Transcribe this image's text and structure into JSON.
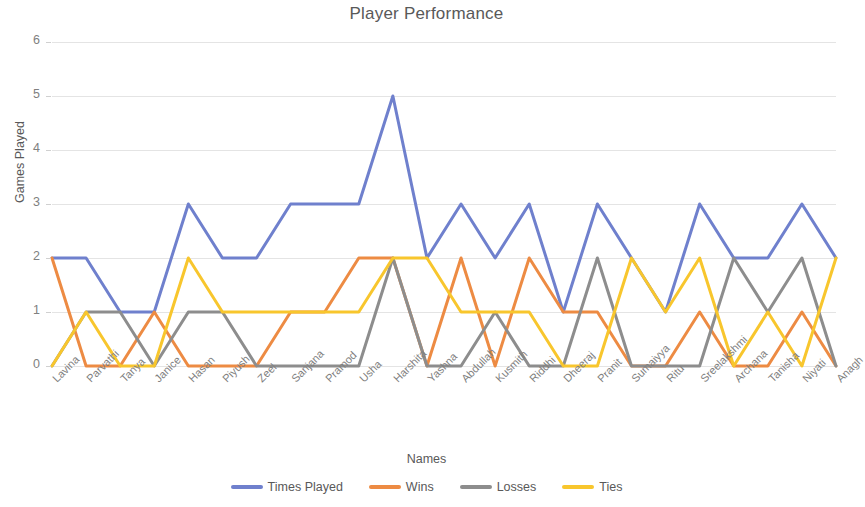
{
  "chart_data": {
    "type": "line",
    "title": "Player Performance",
    "xlabel": "Names",
    "ylabel": "Games Played",
    "ylim": [
      0,
      6
    ],
    "yticks": [
      0,
      1,
      2,
      3,
      4,
      5,
      6
    ],
    "grid": true,
    "legend_position": "bottom",
    "categories": [
      "Lavina",
      "Parvathi",
      "Tanya",
      "Janice",
      "Hasan",
      "Piyush",
      "Zeel",
      "Sanjana",
      "Pramod",
      "Usha",
      "Harshita",
      "Yashna",
      "Abdullah",
      "Kusmith",
      "Riddhi",
      "Dheeraj",
      "Pranit",
      "Sumaiyya",
      "Ritu",
      "Sreelakshmi",
      "Archana",
      "Tanisha",
      "Niyati",
      "Anagh"
    ],
    "series": [
      {
        "name": "Times Played",
        "color": "#6f80cd",
        "values": [
          2,
          2,
          1,
          1,
          3,
          2,
          2,
          3,
          3,
          3,
          5,
          2,
          3,
          2,
          3,
          1,
          3,
          2,
          1,
          3,
          2,
          2,
          3,
          2
        ]
      },
      {
        "name": "Wins",
        "color": "#ed8b43",
        "values": [
          2,
          0,
          0,
          1,
          0,
          0,
          0,
          1,
          1,
          2,
          2,
          0,
          2,
          0,
          2,
          1,
          1,
          0,
          0,
          1,
          0,
          0,
          1,
          0
        ]
      },
      {
        "name": "Losses",
        "color": "#8d8d8d",
        "values": [
          0,
          1,
          1,
          0,
          1,
          1,
          0,
          0,
          0,
          0,
          2,
          0,
          0,
          1,
          0,
          0,
          2,
          0,
          0,
          0,
          2,
          1,
          2,
          0
        ]
      },
      {
        "name": "Ties",
        "color": "#f8c62d",
        "values": [
          0,
          1,
          0,
          0,
          2,
          1,
          1,
          1,
          1,
          1,
          2,
          2,
          1,
          1,
          1,
          0,
          0,
          2,
          1,
          2,
          0,
          1,
          0,
          2
        ]
      }
    ]
  },
  "legend": {
    "items": [
      {
        "label": "Times Played",
        "color": "#6f80cd"
      },
      {
        "label": "Wins",
        "color": "#ed8b43"
      },
      {
        "label": "Losses",
        "color": "#8d8d8d"
      },
      {
        "label": "Ties",
        "color": "#f8c62d"
      }
    ]
  }
}
